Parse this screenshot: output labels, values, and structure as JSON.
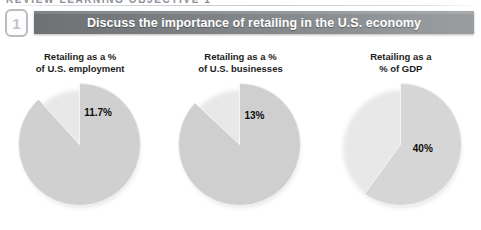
{
  "running_header": {
    "text": "REVIEW LEARNING OBJECTIVE 1"
  },
  "objective": {
    "number": "1"
  },
  "banner": {
    "title": "Discuss the importance of retailing in the U.S. economy"
  },
  "colors": {
    "banner_dark": "#6e7174",
    "banner_light": "#9a9d9f",
    "pie_base": "#d0d0d0",
    "slice_dark": "#b4b4b4",
    "slice_light": "#e3e3e3",
    "badge_border": "#b9bbbe",
    "caption_text": "#1d1d1d"
  },
  "chart_data": [
    {
      "type": "pie",
      "title": "Retailing as a %\nof U.S. employment",
      "categories": [
        "Retailing",
        "Other"
      ],
      "values": [
        11.7,
        88.3
      ],
      "labels": [
        "11.7%",
        ""
      ],
      "slice_colors": [
        "#b4b4b4",
        "#d0d0d0"
      ],
      "start_angle_deg": 0,
      "label_pos": {
        "x": 66,
        "y": 24
      }
    },
    {
      "type": "pie",
      "title": "Retailing as a %\nof U.S. businesses",
      "categories": [
        "Retailing",
        "Other"
      ],
      "values": [
        13,
        87
      ],
      "labels": [
        "13%",
        ""
      ],
      "slice_colors": [
        "#e3e3e3",
        "#cfcfcf"
      ],
      "start_angle_deg": 0,
      "label_pos": {
        "x": 66,
        "y": 27
      }
    },
    {
      "type": "pie",
      "title": "Retailing as a\n% of GDP",
      "categories": [
        "Retailing",
        "Other"
      ],
      "values": [
        40,
        60
      ],
      "labels": [
        "40%",
        ""
      ],
      "slice_colors": [
        "#b4b4b4",
        "#d6d6d6"
      ],
      "start_angle_deg": 0,
      "label_pos": {
        "x": 74,
        "y": 60
      }
    }
  ]
}
